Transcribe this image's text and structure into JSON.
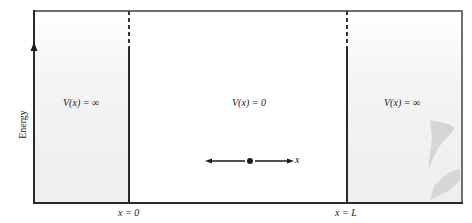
{
  "diagram": {
    "y_axis_label": "Energy",
    "regions": [
      {
        "id": "left-wall",
        "label": "V(x) = ∞"
      },
      {
        "id": "well",
        "label": "V(x) = 0"
      },
      {
        "id": "right-wall",
        "label": "V(x) = ∞"
      }
    ],
    "boundaries": [
      {
        "id": "left",
        "label": "x = 0"
      },
      {
        "id": "right",
        "label": "x = L"
      }
    ],
    "particle": {
      "axis_label": "x"
    },
    "colors": {
      "frame": "#6f6f6f",
      "wall_fill": "#eeeeee",
      "well_fill": "#ffffff",
      "ink": "#1a1a1a"
    }
  }
}
